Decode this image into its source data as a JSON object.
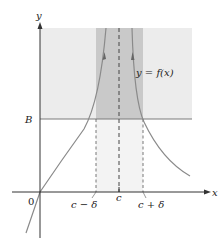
{
  "diagram": {
    "axes": {
      "x_label": "x",
      "y_label": "y",
      "origin_label": "0"
    },
    "horizontal_line": {
      "label": "B"
    },
    "vertical_markers": {
      "left": "c − δ",
      "center": "c",
      "right": "c + δ"
    },
    "curve_label": "y = f(x)",
    "colors": {
      "light_region": "#ececec",
      "dark_region": "#c9c9c9",
      "band_region": "#f3f3f3",
      "curve": "#8a8a8a",
      "axis": "#333333"
    }
  }
}
